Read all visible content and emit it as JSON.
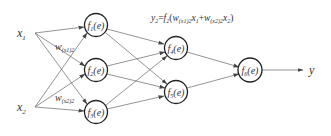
{
  "diagram": {
    "title_formula": {
      "y": "y",
      "ysub": "2",
      "eq": "=",
      "f": "f",
      "fsub": "2",
      "open": "(",
      "w1": "w",
      "w1sub": "(x1)2",
      "x1": "x",
      "x1sub": "1",
      "plus": "+",
      "w2": "w",
      "w2sub": "(x2)2",
      "x2": "x",
      "x2sub": "2",
      "close": ")"
    },
    "inputs": [
      {
        "name": "x",
        "sub": "1"
      },
      {
        "name": "x",
        "sub": "2"
      }
    ],
    "weight_labels": [
      {
        "name": "w",
        "sub": "(x1)2"
      },
      {
        "name": "w",
        "sub": "(x2)2"
      }
    ],
    "nodes": [
      {
        "f": "f",
        "sub": "1",
        "arg": "(e)"
      },
      {
        "f": "f",
        "sub": "2",
        "arg": "(e)"
      },
      {
        "f": "f",
        "sub": "3",
        "arg": "(e)"
      },
      {
        "f": "f",
        "sub": "4",
        "arg": "(e)"
      },
      {
        "f": "f",
        "sub": "5",
        "arg": "(e)"
      },
      {
        "f": "f",
        "sub": "6",
        "arg": "(e)"
      }
    ],
    "output": {
      "name": "y"
    },
    "colors": {
      "stroke": "#222222",
      "edge": "#555555",
      "text": "#333333"
    }
  }
}
